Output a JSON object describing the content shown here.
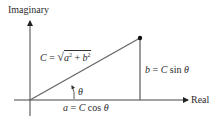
{
  "diagram": {
    "axes": {
      "vertical_label": "Imaginary",
      "horizontal_label": "Real"
    },
    "labels": {
      "hypotenuse": "C = √(a² + b²)",
      "hypotenuse_C": "C",
      "hypotenuse_eq": " = ",
      "hypotenuse_a": "a",
      "hypotenuse_plus": " + ",
      "hypotenuse_b": "b",
      "hypotenuse_sup": "2",
      "opposite": "b = C sin θ",
      "opposite_b": "b",
      "opposite_eq": " = ",
      "opposite_C": "C",
      "opposite_rest": " sin ",
      "opposite_theta": "θ",
      "adjacent": "a = C cos θ",
      "adjacent_a": "a",
      "adjacent_eq": " = ",
      "adjacent_C": "C",
      "adjacent_rest": " cos ",
      "adjacent_theta": "θ",
      "angle": "θ"
    },
    "colors": {
      "line": "#555555",
      "axis": "#333333",
      "text": "#2b2b2b"
    }
  }
}
